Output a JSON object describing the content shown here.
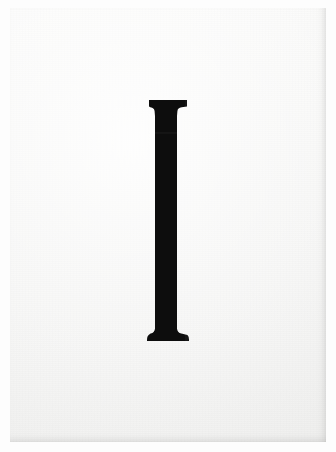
{
  "image": {
    "subject": "serif-capital-letter-I",
    "description": "A single serif capital letter I printed in black on an off-white sheet of paper",
    "orientation": "portrait",
    "width_px": 336,
    "height_px": 452
  },
  "palette": {
    "outer_background": "#fdfdfd",
    "paper_base": "#f7f7f6",
    "paper_highlight": "#fbfbfa",
    "paper_shade": "#f3f3f2",
    "glyph_ink": "#0b0b0b",
    "glyph_ink_soft": "#1a1a1a",
    "edge_shadow": "#787876"
  },
  "paper": {
    "left_px": 10,
    "top_px": 8,
    "width_px": 316,
    "height_px": 434
  },
  "glyph": {
    "character": "I",
    "case": "uppercase",
    "style": "serif",
    "weight": "bold",
    "ink_color": "#0b0b0b",
    "cap_top_y_px": 100,
    "baseline_y_px": 341,
    "cap_height_px": 241,
    "stem_left_x_px": 155,
    "stem_right_x_px": 177,
    "stem_width_px": 22,
    "top_serif_left_x_px": 149,
    "top_serif_right_x_px": 187,
    "top_serif_width_px": 38,
    "top_serif_height_px": 9,
    "bottom_serif_left_x_px": 147,
    "bottom_serif_right_x_px": 189,
    "bottom_serif_width_px": 42,
    "bottom_serif_height_px": 12,
    "center_x_px": 166
  }
}
